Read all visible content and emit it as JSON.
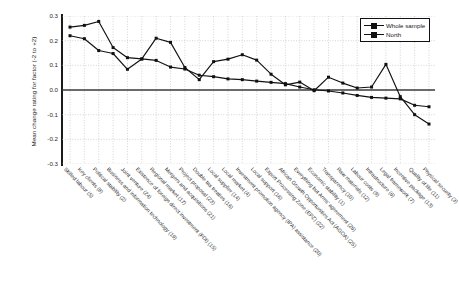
{
  "chart_data": {
    "type": "line",
    "title": "",
    "xlabel": "",
    "ylabel": "Mean change rating for factor (-2 to +2)",
    "ylim": [
      -0.3,
      0.3
    ],
    "yticks": [
      "0.3",
      "0.2",
      "0.1",
      "0.0",
      "-0.1",
      "-0.2",
      "-0.3"
    ],
    "ytick_values": [
      0.3,
      0.2,
      0.1,
      0.0,
      -0.1,
      -0.2,
      -0.3
    ],
    "grid": true,
    "legend_position": "top-right",
    "categories": [
      "Skilled labour (5)",
      "Key clients (8)",
      "Political stability (2)",
      "Business and information technology (19)",
      "Joint venture (24)",
      "Existence of foreign direct investment (FDI) (15)",
      "Regional market (17)",
      "Mergers and acquisitions (21)",
      "Project proposal (23)",
      "Double tax treaties (16)",
      "Local supplier (14)",
      "Local market (4)",
      "Investment promotion agency (IPA) assistance (20)",
      "Local support (16)",
      "Export Processing Zone (EPZ) (22)",
      "African Growth Opportunities Act (AGOA) (25)",
      "Everything but Arms' agreement (26)",
      "Economic stability (1)",
      "Transparency (10)",
      "Raw materials (12)",
      "Labour costs (9)",
      "Infrastructure (6)",
      "Legal framework (7)",
      "Incentive package (13)",
      "Quality of life (11)",
      "Physical security (3)"
    ],
    "series": [
      {
        "name": "Whole sample",
        "color": "#111111",
        "values": [
          0.255,
          0.262,
          0.278,
          0.172,
          0.131,
          0.126,
          0.12,
          0.093,
          0.085,
          0.06,
          0.054,
          0.045,
          0.042,
          0.036,
          0.031,
          0.026,
          0.012,
          0.001,
          -0.004,
          -0.012,
          -0.022,
          -0.03,
          -0.033,
          -0.036,
          -0.062,
          -0.068
        ]
      },
      {
        "name": "North",
        "color": "#111111",
        "values": [
          0.22,
          0.208,
          0.16,
          0.148,
          0.084,
          0.126,
          0.21,
          0.193,
          0.091,
          0.042,
          0.115,
          0.125,
          0.143,
          0.121,
          0.064,
          0.021,
          0.032,
          -0.003,
          0.052,
          0.028,
          0.008,
          0.012,
          0.104,
          -0.027,
          -0.1,
          -0.138
        ]
      }
    ],
    "series_tail": {
      "whole_sample_tail": [
        -0.1,
        -0.139,
        -0.163
      ],
      "north_tail": [
        -0.23,
        -0.262
      ]
    }
  },
  "legend": {
    "items": [
      {
        "label": "Whole sample"
      },
      {
        "label": "North"
      }
    ]
  }
}
